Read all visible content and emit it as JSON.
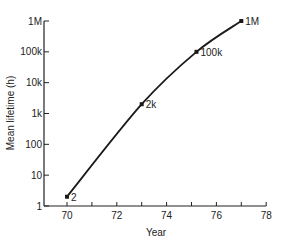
{
  "chart_data": {
    "type": "line",
    "title": "",
    "xlabel": "Year",
    "ylabel": "Mean lifetime (h)",
    "xlim": [
      69.9,
      78
    ],
    "ylim": [
      1,
      1000000
    ],
    "yscale": "log",
    "grid": false,
    "legend": "none",
    "x_ticks": [
      70,
      71,
      72,
      73,
      74,
      75,
      76,
      77,
      78
    ],
    "x_tick_labels": [
      "70",
      "",
      "72",
      "",
      "74",
      "",
      "76",
      "",
      "78"
    ],
    "y_ticks": [
      1,
      10,
      100,
      1000,
      10000,
      100000,
      1000000
    ],
    "y_tick_labels": [
      "1",
      "10",
      "100",
      "1k",
      "10k",
      "100k",
      "1M"
    ],
    "series": [
      {
        "name": "Mean lifetime",
        "x": [
          70,
          73,
          75.2,
          77
        ],
        "y": [
          2,
          2000,
          100000,
          1000000
        ],
        "point_labels": [
          "2",
          "2k",
          "100k",
          "1M"
        ]
      }
    ],
    "color": "#1a1a1a"
  },
  "labels": {
    "xlabel": "Year",
    "ylabel": "Mean lifetime (h)"
  }
}
